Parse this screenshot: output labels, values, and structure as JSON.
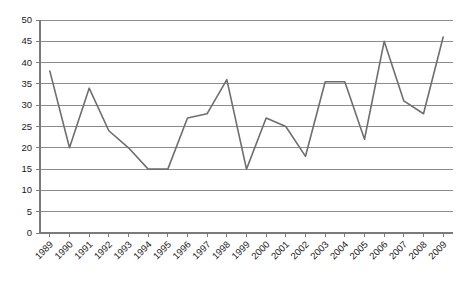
{
  "chart_data": {
    "type": "line",
    "title": "",
    "subtitle": "",
    "xlabel": "",
    "ylabel": "",
    "categories": [
      "1989",
      "1990",
      "1991",
      "1992",
      "1993",
      "1994",
      "1995",
      "1996",
      "1997",
      "1998",
      "1999",
      "2000",
      "2001",
      "2002",
      "2003",
      "2004",
      "2005",
      "2006",
      "2007",
      "2008",
      "2009"
    ],
    "values": [
      38,
      20,
      34,
      24,
      20,
      15,
      15,
      27,
      28,
      36,
      15,
      27,
      25,
      18,
      35.5,
      35.5,
      22,
      45,
      31,
      28,
      46
    ],
    "series": [
      {
        "name": "series-1",
        "color": "#6e6e6e",
        "values": [
          38,
          20,
          34,
          24,
          20,
          15,
          15,
          27,
          28,
          36,
          15,
          27,
          25,
          18,
          35.5,
          35.5,
          22,
          45,
          31,
          28,
          46
        ]
      }
    ],
    "ylim": [
      0,
      50
    ],
    "ytick_step": 5,
    "ytick_labels": [
      "0",
      "5",
      "10",
      "15",
      "20",
      "25",
      "30",
      "35",
      "40",
      "45",
      "50"
    ],
    "xtick_labels": [
      "1989",
      "1990",
      "1991",
      "1992",
      "1993",
      "1994",
      "1995",
      "1996",
      "1997",
      "1998",
      "1999",
      "2000",
      "2001",
      "2002",
      "2003",
      "2004",
      "2005",
      "2006",
      "2007",
      "2008",
      "2009"
    ],
    "grid": true,
    "grid_axis": "y",
    "legend": false,
    "legend_position": "none",
    "annotations": [],
    "xlabel_rotation_deg": 45,
    "colors": {
      "line": "#6e6e6e",
      "grid": "#8c8c8c",
      "axis": "#7a7a7a",
      "text": "#1a1a1a",
      "background": "#ffffff"
    }
  },
  "plot_geometry": {
    "left": 40,
    "right": 453,
    "top": 20,
    "bottom": 233
  }
}
